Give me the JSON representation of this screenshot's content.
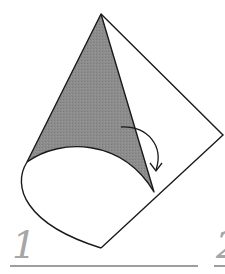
{
  "diagram": {
    "steps": [
      {
        "number": "1"
      },
      {
        "number": "2"
      }
    ],
    "colors": {
      "background": "#ffffff",
      "stroke": "#1a1a1a",
      "shaded_surface": "#8c8c8c",
      "label": "#a6a6a6",
      "rule": "#9e9e9e"
    },
    "shapes": {
      "sheet_outline": "M101,14 L223,135 L101,248",
      "cone_shaded": "M101,14 L27,162 C60,140 120,140 154,192 Z",
      "cone_base_front": "M27,162 C12,185 25,222 101,248",
      "arrow_path": "M121,128 C150,128 165,148 156,170",
      "arrow_head": "M150,164 L156,171 L162,163"
    }
  }
}
